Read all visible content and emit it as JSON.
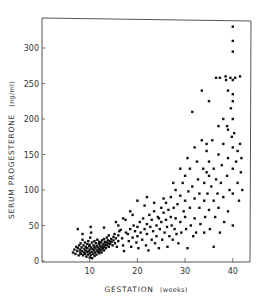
{
  "chart_data": {
    "type": "scatter",
    "title": "",
    "xlabel": "GESTATION",
    "xlabel_unit": "(weeks)",
    "ylabel": "SERUM PROGESTERONE",
    "ylabel_unit": "(ng/ml)",
    "xlim": [
      0,
      43.5
    ],
    "ylim": [
      0,
      335
    ],
    "xticks": [
      10,
      20,
      30,
      40
    ],
    "yticks": [
      0,
      50,
      100,
      150,
      200,
      250,
      300
    ],
    "grid": false,
    "legend": null,
    "marker_color": "#111111",
    "points": [
      [
        6.5,
        12
      ],
      [
        6.8,
        16
      ],
      [
        7,
        10
      ],
      [
        7.2,
        20
      ],
      [
        7.4,
        14
      ],
      [
        7.5,
        18
      ],
      [
        7.7,
        8
      ],
      [
        7.8,
        22
      ],
      [
        8,
        12
      ],
      [
        8,
        16
      ],
      [
        8.1,
        25
      ],
      [
        8.2,
        10
      ],
      [
        8.3,
        19
      ],
      [
        8.4,
        14
      ],
      [
        8.5,
        30
      ],
      [
        8.6,
        8
      ],
      [
        8.7,
        22
      ],
      [
        8.8,
        12
      ],
      [
        8.9,
        17
      ],
      [
        9,
        26
      ],
      [
        9,
        10
      ],
      [
        9.1,
        15
      ],
      [
        9.2,
        20
      ],
      [
        9.3,
        6
      ],
      [
        9.4,
        13
      ],
      [
        9.5,
        24
      ],
      [
        9.5,
        18
      ],
      [
        9.6,
        9
      ],
      [
        9.7,
        28
      ],
      [
        9.8,
        14
      ],
      [
        9.9,
        21
      ],
      [
        10,
        5
      ],
      [
        10,
        11
      ],
      [
        10,
        16
      ],
      [
        10,
        23
      ],
      [
        10.1,
        33
      ],
      [
        10.2,
        8
      ],
      [
        10.3,
        19
      ],
      [
        10.4,
        13
      ],
      [
        10.5,
        26
      ],
      [
        10.5,
        4
      ],
      [
        10.6,
        17
      ],
      [
        10.7,
        10
      ],
      [
        10.8,
        22
      ],
      [
        10.9,
        15
      ],
      [
        11,
        7
      ],
      [
        11,
        20
      ],
      [
        11,
        28
      ],
      [
        11.1,
        12
      ],
      [
        11.2,
        18
      ],
      [
        11.3,
        25
      ],
      [
        11.4,
        9
      ],
      [
        11.5,
        15
      ],
      [
        11.5,
        21
      ],
      [
        11.6,
        30
      ],
      [
        11.7,
        13
      ],
      [
        11.8,
        19
      ],
      [
        11.9,
        24
      ],
      [
        12,
        11
      ],
      [
        12,
        17
      ],
      [
        12,
        27
      ],
      [
        12.1,
        14
      ],
      [
        12.2,
        22
      ],
      [
        12.3,
        19
      ],
      [
        12.4,
        26
      ],
      [
        12.5,
        16
      ],
      [
        12.5,
        12
      ],
      [
        12.6,
        29
      ],
      [
        12.7,
        21
      ],
      [
        12.8,
        18
      ],
      [
        12.9,
        24
      ],
      [
        13,
        15
      ],
      [
        13,
        31
      ],
      [
        13.1,
        20
      ],
      [
        13.2,
        27
      ],
      [
        13.3,
        23
      ],
      [
        13.4,
        18
      ],
      [
        13.5,
        26
      ],
      [
        13.6,
        33
      ],
      [
        13.7,
        22
      ],
      [
        13.8,
        29
      ],
      [
        13.9,
        25
      ],
      [
        14,
        20
      ],
      [
        14,
        36
      ],
      [
        14.2,
        28
      ],
      [
        14.3,
        24
      ],
      [
        14.5,
        31
      ],
      [
        14.6,
        27
      ],
      [
        14.8,
        22
      ],
      [
        15,
        34
      ],
      [
        15,
        29
      ],
      [
        15.2,
        38
      ],
      [
        15.3,
        25
      ],
      [
        15.5,
        32
      ],
      [
        15.7,
        20
      ],
      [
        16,
        36
      ],
      [
        16,
        28
      ],
      [
        16.2,
        42
      ],
      [
        7.5,
        45
      ],
      [
        8.5,
        38
      ],
      [
        10.2,
        48
      ],
      [
        10.3,
        40
      ],
      [
        13,
        47
      ],
      [
        15.5,
        55
      ],
      [
        17.5,
        58
      ],
      [
        16.5,
        44
      ],
      [
        16.8,
        32
      ],
      [
        17,
        22
      ],
      [
        17.2,
        14
      ],
      [
        17.6,
        40
      ],
      [
        18,
        38
      ],
      [
        18.2,
        28
      ],
      [
        18.5,
        45
      ],
      [
        18.7,
        20
      ],
      [
        19,
        33
      ],
      [
        19.2,
        50
      ],
      [
        19.5,
        42
      ],
      [
        19.8,
        26
      ],
      [
        20,
        35
      ],
      [
        20,
        48
      ],
      [
        20.2,
        18
      ],
      [
        20.5,
        55
      ],
      [
        20.7,
        40
      ],
      [
        21,
        30
      ],
      [
        21.2,
        60
      ],
      [
        21.5,
        45
      ],
      [
        21.8,
        22
      ],
      [
        22,
        52
      ],
      [
        22,
        38
      ],
      [
        22.3,
        15
      ],
      [
        22.5,
        65
      ],
      [
        22.7,
        48
      ],
      [
        23,
        30
      ],
      [
        23,
        58
      ],
      [
        23.3,
        42
      ],
      [
        23.5,
        70
      ],
      [
        23.7,
        25
      ],
      [
        24,
        50
      ],
      [
        24,
        35
      ],
      [
        24.3,
        62
      ],
      [
        24.5,
        18
      ],
      [
        24.7,
        45
      ],
      [
        25,
        75
      ],
      [
        25,
        55
      ],
      [
        25.2,
        30
      ],
      [
        25.5,
        68
      ],
      [
        25.7,
        40
      ],
      [
        26,
        82
      ],
      [
        26,
        58
      ],
      [
        26.2,
        48
      ],
      [
        26.3,
        20
      ],
      [
        26.5,
        72
      ],
      [
        26.7,
        35
      ],
      [
        27,
        90
      ],
      [
        27,
        62
      ],
      [
        27.2,
        50
      ],
      [
        27.4,
        30
      ],
      [
        27.6,
        75
      ],
      [
        27.8,
        45
      ],
      [
        28,
        100
      ],
      [
        28,
        60
      ],
      [
        28.2,
        38
      ],
      [
        28.4,
        80
      ],
      [
        28.6,
        25
      ],
      [
        29,
        92
      ],
      [
        29,
        55
      ],
      [
        29.2,
        40
      ],
      [
        29.5,
        110
      ],
      [
        29.7,
        70
      ],
      [
        30,
        120
      ],
      [
        30,
        85
      ],
      [
        30,
        62
      ],
      [
        30.2,
        45
      ],
      [
        30.5,
        18
      ],
      [
        30.7,
        98
      ],
      [
        31,
        130
      ],
      [
        31,
        75
      ],
      [
        31.2,
        50
      ],
      [
        31.5,
        105
      ],
      [
        31.7,
        35
      ],
      [
        32,
        88
      ],
      [
        32,
        60
      ],
      [
        32.3,
        40
      ],
      [
        32.5,
        140
      ],
      [
        32.7,
        115
      ],
      [
        33,
        95
      ],
      [
        33,
        75
      ],
      [
        33.2,
        52
      ],
      [
        33.5,
        170
      ],
      [
        33.8,
        130
      ],
      [
        34,
        110
      ],
      [
        34,
        85
      ],
      [
        34,
        40
      ],
      [
        34.2,
        62
      ],
      [
        34.5,
        125
      ],
      [
        34.5,
        155
      ],
      [
        34.7,
        95
      ],
      [
        35,
        120
      ],
      [
        35,
        140
      ],
      [
        35,
        72
      ],
      [
        35.2,
        45
      ],
      [
        35.5,
        105
      ],
      [
        35.7,
        170
      ],
      [
        36,
        85
      ],
      [
        36,
        130
      ],
      [
        36,
        20
      ],
      [
        36.3,
        62
      ],
      [
        36.5,
        115
      ],
      [
        36.8,
        95
      ],
      [
        37,
        190
      ],
      [
        37,
        150
      ],
      [
        37,
        75
      ],
      [
        37.3,
        40
      ],
      [
        37.5,
        110
      ],
      [
        37.7,
        135
      ],
      [
        38,
        200
      ],
      [
        38,
        165
      ],
      [
        38,
        90
      ],
      [
        38.2,
        55
      ],
      [
        38.5,
        260
      ],
      [
        38.6,
        255
      ],
      [
        38.8,
        120
      ],
      [
        39,
        145
      ],
      [
        39,
        185
      ],
      [
        39,
        240
      ],
      [
        39,
        70
      ],
      [
        39.3,
        100
      ],
      [
        39.5,
        258
      ],
      [
        39.6,
        215
      ],
      [
        39.8,
        175
      ],
      [
        40,
        330
      ],
      [
        40,
        310
      ],
      [
        40,
        295
      ],
      [
        40,
        255
      ],
      [
        40,
        235
      ],
      [
        40,
        225
      ],
      [
        40,
        200
      ],
      [
        40,
        160
      ],
      [
        40,
        130
      ],
      [
        40,
        95
      ],
      [
        40,
        50
      ],
      [
        40.3,
        180
      ],
      [
        40.5,
        258
      ],
      [
        40.7,
        140
      ],
      [
        41,
        110
      ],
      [
        41,
        155
      ],
      [
        41.3,
        85
      ],
      [
        41.5,
        260
      ],
      [
        41.7,
        125
      ],
      [
        42,
        100
      ],
      [
        36.5,
        258
      ],
      [
        37.3,
        258
      ],
      [
        35,
        225
      ],
      [
        33.5,
        240
      ],
      [
        31.5,
        210
      ],
      [
        34.5,
        165
      ],
      [
        38.8,
        190
      ],
      [
        41.5,
        165
      ],
      [
        41.8,
        145
      ],
      [
        20,
        85
      ],
      [
        22,
        90
      ],
      [
        24.5,
        60
      ],
      [
        19,
        65
      ],
      [
        18.5,
        70
      ],
      [
        17,
        60
      ],
      [
        16,
        50
      ],
      [
        21.5,
        78
      ],
      [
        23.5,
        82
      ],
      [
        25.5,
        88
      ],
      [
        27.5,
        110
      ],
      [
        29,
        130
      ],
      [
        30.5,
        145
      ],
      [
        32,
        160
      ]
    ]
  },
  "plot_area": {
    "left_px": 42,
    "right_px": 250,
    "top_px": 19,
    "bottom_px": 261
  }
}
